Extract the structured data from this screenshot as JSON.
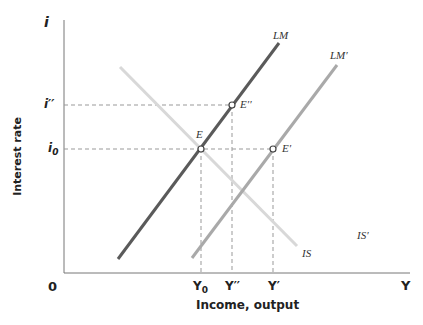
{
  "axes": {
    "y_symbol": "i",
    "x_symbol": "Y",
    "origin": "0",
    "y_label": "Interest rate",
    "x_label": "Income, output",
    "y_ticks": [
      "i′′",
      "i0"
    ],
    "x_ticks": [
      "Y0",
      "Y′′",
      "Y′"
    ]
  },
  "curves": {
    "lm": "LM",
    "lm_prime": "LM′",
    "is": "IS",
    "is_prime": "IS′"
  },
  "points": {
    "e": "E",
    "e_double_prime": "E′′",
    "e_prime": "E′"
  },
  "colors": {
    "lm": "#5a5a5a",
    "lm_prime": "#a9a9a9",
    "is": "#d8d8d8",
    "axis": "#777777",
    "dash": "#999999"
  }
}
